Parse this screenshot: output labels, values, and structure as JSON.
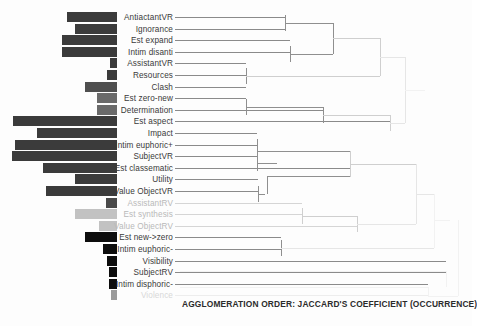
{
  "chart_data": {
    "type": "bar",
    "title": "",
    "subtitle": "",
    "xlabel": "AGGLOMERATION ORDER: JACCARD'S COEFFICIENT (OCCURRENCE)",
    "ylabel": "",
    "grid": false,
    "legend": "none",
    "orientation": "horizontal",
    "note": "Dendrogram (hierarchical cluster tree) with a horizontal bar chart of occurrence counts to the left of the leaf labels. Bars are right-aligned to the label column and extend leftward.",
    "categories": [
      "AntiactantVR",
      "Ignorance",
      "Est expand",
      "Intim disanti",
      "AssistantVR",
      "Resources",
      "Clash",
      "Est zero-new",
      "Determination",
      "Est aspect",
      "Impact",
      "Intim euphoric+",
      "SubjectVR",
      "Est classematic",
      "Utility",
      "Value ObjectVR",
      "AssistantRV",
      "Est synthesis",
      "Value ObjectRV",
      "Est new->zero",
      "Intim euphoric-",
      "Visibility",
      "SubjectRV",
      "Intim disphoric-",
      "Violence"
    ],
    "values": [
      36,
      30,
      39,
      39,
      5,
      7,
      23,
      14,
      14,
      74,
      57,
      73,
      75,
      53,
      30,
      51,
      8,
      30,
      13,
      23,
      10,
      7,
      6,
      6,
      4
    ],
    "bar_colors": [
      "#3b3b3b",
      "#3b3b3b",
      "#3b3b3b",
      "#3b3b3b",
      "#3b3b3b",
      "#3b3b3b",
      "#4f4f4f",
      "#6a6a6a",
      "#6a6a6a",
      "#3b3b3b",
      "#3b3b3b",
      "#3b3b3b",
      "#3b3b3b",
      "#3b3b3b",
      "#3b3b3b",
      "#3b3b3b",
      "#4a4a4a",
      "#c2c2c2",
      "#c2c2c2",
      "#0d0d0d",
      "#0d0d0d",
      "#0d0d0d",
      "#0d0d0d",
      "#0d0d0d",
      "#9a9a9a"
    ],
    "label_styles": [
      "dark",
      "dark",
      "dark",
      "dark",
      "dark",
      "dark",
      "dark",
      "dark",
      "dark",
      "dark",
      "dark",
      "dark",
      "dark",
      "dark",
      "dark",
      "dark",
      "faint",
      "faint",
      "faint",
      "dark",
      "dark",
      "dark",
      "dark",
      "dark",
      "vfaint"
    ]
  },
  "labels": {
    "l0": "AntiactantVR",
    "l1": "Ignorance",
    "l2": "Est expand",
    "l3": "Intim disanti",
    "l4": "AssistantVR",
    "l5": "Resources",
    "l6": "Clash",
    "l7": "Est zero-new",
    "l8": "Determination",
    "l9": "Est aspect",
    "l10": "Impact",
    "l11": "Intim euphoric+",
    "l12": "SubjectVR",
    "l13": "Est classematic",
    "l14": "Utility",
    "l15": "Value ObjectVR",
    "l16": "AssistantRV",
    "l17": "Est synthesis",
    "l18": "Value ObjectRV",
    "l19": "Est new->zero",
    "l20": "Intim euphoric-",
    "l21": "Visibility",
    "l22": "SubjectRV",
    "l23": "Intim disphoric-",
    "l24": "Violence"
  },
  "axis": {
    "title": "AGGLOMERATION ORDER: JACCARD'S COEFFICIENT (OCCURRENCE)"
  }
}
